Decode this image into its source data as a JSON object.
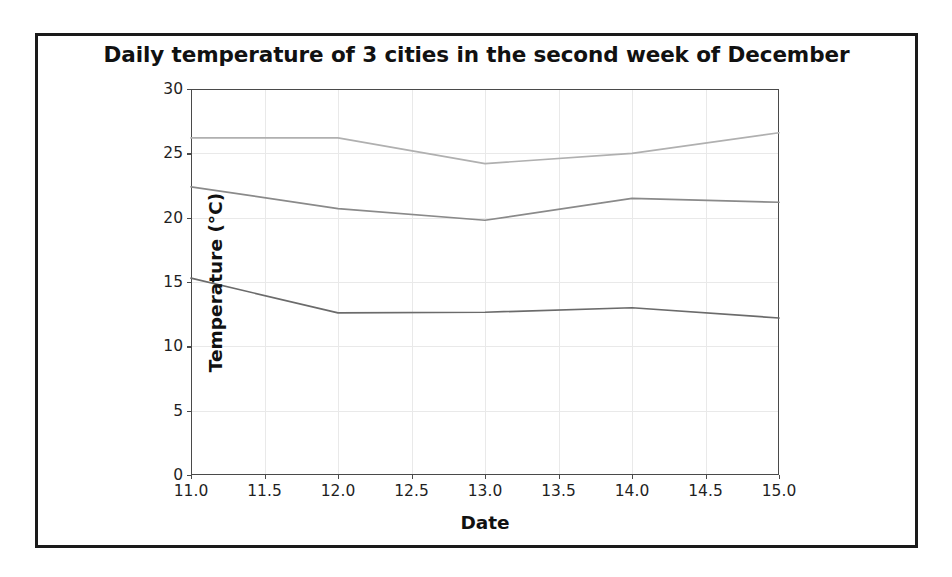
{
  "figure": {
    "background_color": "#ffffff",
    "border_color": "#1a1a1a",
    "axes_color": "#4a4a4a",
    "grid_color": "#e9e9e9"
  },
  "chart_data": {
    "type": "line",
    "title": "Daily temperature of 3 cities in the second week of December",
    "xlabel": "Date",
    "ylabel": "Temperature (°C)",
    "xlim": [
      11.0,
      15.0
    ],
    "ylim": [
      0,
      30
    ],
    "grid": true,
    "legend": "none",
    "x": [
      11,
      12,
      13,
      14,
      15
    ],
    "xticks": [
      "11.0",
      "11.5",
      "12.0",
      "12.5",
      "13.0",
      "13.5",
      "14.0",
      "14.5",
      "15.0"
    ],
    "xtick_values": [
      11.0,
      11.5,
      12.0,
      12.5,
      13.0,
      13.5,
      14.0,
      14.5,
      15.0
    ],
    "yticks": [
      "0",
      "5",
      "10",
      "15",
      "20",
      "25",
      "30"
    ],
    "ytick_values": [
      0,
      5,
      10,
      15,
      20,
      25,
      30
    ],
    "series": [
      {
        "name": "city-1-top-line",
        "color": "#b0b0b0",
        "values": [
          26.2,
          26.2,
          24.2,
          25.0,
          26.6
        ]
      },
      {
        "name": "city-2-middle-line",
        "color": "#8a8a8a",
        "values": [
          22.4,
          20.7,
          19.8,
          21.5,
          21.2
        ]
      },
      {
        "name": "city-3-bottom-line",
        "color": "#6b6b6b",
        "values": [
          15.3,
          12.6,
          12.65,
          13.0,
          12.2
        ]
      }
    ]
  }
}
